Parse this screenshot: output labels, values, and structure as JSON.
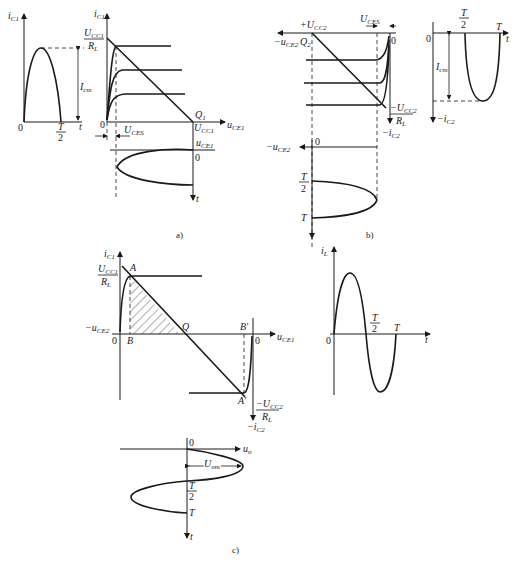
{
  "figure": {
    "panels": [
      {
        "id": "a",
        "caption": "a)",
        "waveform": {
          "y_axis": "i",
          "y_sub": "C1",
          "x_axis": "t",
          "origin": "0",
          "half_period_num": "T",
          "half_period_den": "2",
          "amplitude": "I",
          "amplitude_sub": "cm"
        },
        "output_characteristic": {
          "y_axis": "i",
          "y_sub": "C1",
          "x_axis": "u",
          "x_sub": "CE1",
          "intercept_num": "U",
          "intercept_num_sub": "CC1",
          "intercept_den": "R",
          "intercept_den_sub": "L",
          "q_point": "Q",
          "q_sub": "1",
          "supply": "U",
          "supply_sub": "CC1",
          "origin": "0",
          "saturation": "U",
          "saturation_sub": "CES"
        },
        "voltage_waveform": {
          "x_axis": "u",
          "x_sub": "CE1",
          "origin": "0",
          "time_axis": "t"
        }
      },
      {
        "id": "b",
        "caption": "b)",
        "output_characteristic": {
          "supply": "+U",
          "supply_sub": "CC2",
          "x_axis": "−u",
          "x_sub": "CE2",
          "q_point": "Q",
          "q_sub": "2",
          "saturation": "U",
          "saturation_sub": "CES",
          "origin": "0",
          "intercept_num": "−U",
          "intercept_num_sub": "CC2",
          "intercept_den": "R",
          "intercept_den_sub": "L",
          "y_axis": "−i",
          "y_sub": "C2"
        },
        "waveform": {
          "origin": "0",
          "half_period_num": "T",
          "half_period_den": "2",
          "period": "T",
          "x_axis": "t",
          "amplitude": "I",
          "amplitude_sub": "cm",
          "y_axis": "−i",
          "y_sub": "C2"
        },
        "voltage_waveform": {
          "x_axis": "−u",
          "x_sub": "CE2",
          "origin": "0",
          "half_period_num": "T",
          "half_period_den": "2",
          "period": "T"
        }
      },
      {
        "id": "c",
        "caption": "c)",
        "combined_characteristic": {
          "y_axis": "i",
          "y_sub": "C1",
          "intercept_num": "U",
          "intercept_num_sub": "CC1",
          "intercept_den": "R",
          "intercept_den_sub": "L",
          "point_a": "A",
          "point_b": "B",
          "point_q": "Q",
          "point_b_prime": "B′",
          "point_a_prime": "A′",
          "left_axis": "−u",
          "left_sub": "CE2",
          "origin_left": "0",
          "origin_right": "0",
          "x_axis": "u",
          "x_sub": "CE1",
          "intercept2_num": "−U",
          "intercept2_num_sub": "CC2",
          "intercept2_den": "R",
          "intercept2_den_sub": "L",
          "bottom_axis": "−i",
          "bottom_sub": "C2"
        },
        "load_current": {
          "y_axis": "i",
          "y_sub": "L",
          "origin": "0",
          "half_period_num": "T",
          "half_period_den": "2",
          "period": "T",
          "x_axis": "t"
        },
        "output_voltage": {
          "x_axis": "u",
          "x_sub": "o",
          "origin": "0",
          "amplitude": "U",
          "amplitude_sub": "om",
          "half_period_num": "T",
          "half_period_den": "2",
          "period": "T",
          "time_axis": "t"
        }
      }
    ]
  }
}
